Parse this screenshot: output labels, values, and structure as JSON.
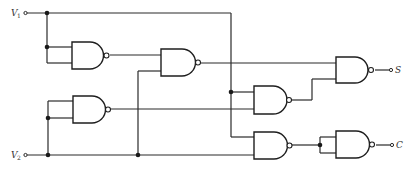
{
  "diagram": {
    "type": "logic-circuit",
    "inputs": [
      {
        "label": "V",
        "subscript": "1"
      },
      {
        "label": "V",
        "subscript": "2"
      }
    ],
    "outputs": [
      {
        "label": "S"
      },
      {
        "label": "C"
      }
    ],
    "gates": [
      {
        "id": "g1",
        "type": "NAND",
        "inputs": [
          "V1",
          "V1"
        ]
      },
      {
        "id": "g6",
        "type": "NAND",
        "inputs": [
          "V2",
          "V2"
        ]
      },
      {
        "id": "g2",
        "type": "NAND",
        "inputs": [
          "g1",
          "V2"
        ]
      },
      {
        "id": "g3",
        "type": "NAND",
        "inputs": [
          "V1",
          "g6"
        ]
      },
      {
        "id": "gS",
        "type": "NAND",
        "inputs": [
          "g2",
          "g3"
        ],
        "output": "S"
      },
      {
        "id": "g4",
        "type": "NAND",
        "inputs": [
          "V1",
          "V2"
        ]
      },
      {
        "id": "g5",
        "type": "NAND",
        "inputs": [
          "g4",
          "g4"
        ],
        "output": "C"
      }
    ]
  }
}
